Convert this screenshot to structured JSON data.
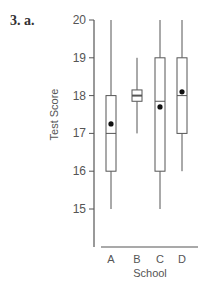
{
  "question_label": "3. a.",
  "chart_data": {
    "type": "box",
    "title": "",
    "xlabel": "School",
    "ylabel": "Test Score",
    "ylim": [
      14,
      20
    ],
    "yticks": [
      15,
      16,
      17,
      18,
      19,
      20
    ],
    "grid": false,
    "categories": [
      "A",
      "B",
      "C",
      "D"
    ],
    "boxes": [
      {
        "name": "A",
        "min": 15,
        "q1": 16,
        "median": 17,
        "q3": 18,
        "max": 20,
        "mean": 17.25
      },
      {
        "name": "B",
        "min": 17,
        "q1": 17.85,
        "median": 18,
        "q3": 18.15,
        "max": 19,
        "mean": 18
      },
      {
        "name": "C",
        "min": 15,
        "q1": 16,
        "median": 17.85,
        "q3": 19,
        "max": 20,
        "mean": 17.7
      },
      {
        "name": "D",
        "min": 16,
        "q1": 17,
        "median": 18,
        "q3": 19,
        "max": 20,
        "mean": 18.1
      }
    ]
  }
}
